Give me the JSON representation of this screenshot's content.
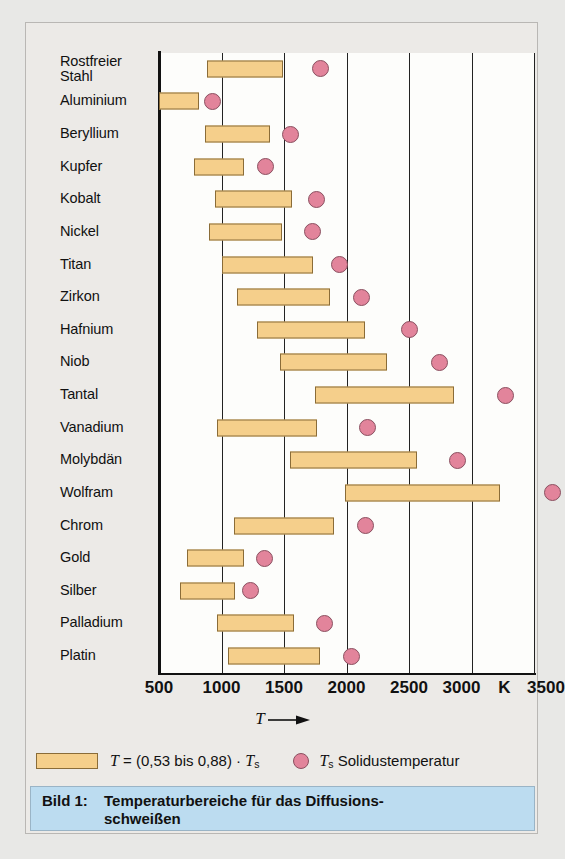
{
  "chart_data": {
    "type": "bar",
    "xlabel": "T",
    "ylabel": "",
    "unit": "K",
    "xlim": [
      500,
      3500
    ],
    "xticks": [
      500,
      1000,
      1500,
      2000,
      2500,
      3000,
      3500
    ],
    "xtick_labels": [
      "500",
      "1000",
      "1500",
      "2000",
      "2500",
      "3000",
      "3500"
    ],
    "grid": true,
    "orientation": "horizontal",
    "categories": [
      "Rostfreier Stahl",
      "Aluminium",
      "Beryllium",
      "Kupfer",
      "Kobalt",
      "Nickel",
      "Titan",
      "Zirkon",
      "Hafnium",
      "Niob",
      "Tantal",
      "Vanadium",
      "Molybdän",
      "Wolfram",
      "Chrom",
      "Gold",
      "Silber",
      "Palladium",
      "Platin"
    ],
    "series": [
      {
        "name": "T = (0,53 bis 0,88) · Ts",
        "type": "range-bar",
        "color": "#f5cf8b",
        "ranges": [
          [
            880,
            1490
          ],
          [
            500,
            820
          ],
          [
            870,
            1390
          ],
          [
            780,
            1180
          ],
          [
            950,
            1560
          ],
          [
            900,
            1480
          ],
          [
            1000,
            1730
          ],
          [
            1120,
            1870
          ],
          [
            1280,
            2150
          ],
          [
            1470,
            2320
          ],
          [
            1750,
            2860
          ],
          [
            960,
            1760
          ],
          [
            1550,
            2560
          ],
          [
            1990,
            3230
          ],
          [
            1100,
            1900
          ],
          [
            720,
            1180
          ],
          [
            670,
            1110
          ],
          [
            960,
            1580
          ],
          [
            1050,
            1790
          ]
        ]
      },
      {
        "name": "Ts Solidustemperatur",
        "type": "point",
        "color": "#e2849b",
        "values": [
          1790,
          930,
          1550,
          1350,
          1760,
          1730,
          1940,
          2120,
          2500,
          2740,
          3270,
          2170,
          2890,
          3650,
          2150,
          1340,
          1230,
          1820,
          2040
        ]
      }
    ]
  },
  "rows": [
    {
      "label": "Rostfreier Stahl",
      "label_lines": [
        "Rostfreier",
        "Stahl"
      ],
      "bar_min": 880,
      "bar_max": 1490,
      "dot": 1790
    },
    {
      "label": "Aluminium",
      "label_lines": [
        "Aluminium"
      ],
      "bar_min": 500,
      "bar_max": 820,
      "dot": 930
    },
    {
      "label": "Beryllium",
      "label_lines": [
        "Beryllium"
      ],
      "bar_min": 870,
      "bar_max": 1390,
      "dot": 1550
    },
    {
      "label": "Kupfer",
      "label_lines": [
        "Kupfer"
      ],
      "bar_min": 780,
      "bar_max": 1180,
      "dot": 1350
    },
    {
      "label": "Kobalt",
      "label_lines": [
        "Kobalt"
      ],
      "bar_min": 950,
      "bar_max": 1560,
      "dot": 1760
    },
    {
      "label": "Nickel",
      "label_lines": [
        "Nickel"
      ],
      "bar_min": 900,
      "bar_max": 1480,
      "dot": 1730
    },
    {
      "label": "Titan",
      "label_lines": [
        "Titan"
      ],
      "bar_min": 1000,
      "bar_max": 1730,
      "dot": 1940
    },
    {
      "label": "Zirkon",
      "label_lines": [
        "Zirkon"
      ],
      "bar_min": 1120,
      "bar_max": 1870,
      "dot": 2120
    },
    {
      "label": "Hafnium",
      "label_lines": [
        "Hafnium"
      ],
      "bar_min": 1280,
      "bar_max": 2150,
      "dot": 2500
    },
    {
      "label": "Niob",
      "label_lines": [
        "Niob"
      ],
      "bar_min": 1470,
      "bar_max": 2320,
      "dot": 2740
    },
    {
      "label": "Tantal",
      "label_lines": [
        "Tantal"
      ],
      "bar_min": 1750,
      "bar_max": 2860,
      "dot": 3270
    },
    {
      "label": "Vanadium",
      "label_lines": [
        "Vanadium"
      ],
      "bar_min": 960,
      "bar_max": 1760,
      "dot": 2170
    },
    {
      "label": "Molybdän",
      "label_lines": [
        "Molybdän"
      ],
      "bar_min": 1550,
      "bar_max": 2560,
      "dot": 2890
    },
    {
      "label": "Wolfram",
      "label_lines": [
        "Wolfram"
      ],
      "bar_min": 1990,
      "bar_max": 3230,
      "dot": 3650
    },
    {
      "label": "Chrom",
      "label_lines": [
        "Chrom"
      ],
      "bar_min": 1100,
      "bar_max": 1900,
      "dot": 2150
    },
    {
      "label": "Gold",
      "label_lines": [
        "Gold"
      ],
      "bar_min": 720,
      "bar_max": 1180,
      "dot": 1340
    },
    {
      "label": "Silber",
      "label_lines": [
        "Silber"
      ],
      "bar_min": 670,
      "bar_max": 1110,
      "dot": 1230
    },
    {
      "label": "Palladium",
      "label_lines": [
        "Palladium"
      ],
      "bar_min": 960,
      "bar_max": 1580,
      "dot": 1820
    },
    {
      "label": "Platin",
      "label_lines": [
        "Platin"
      ],
      "bar_min": 1050,
      "bar_max": 1790,
      "dot": 2040
    }
  ],
  "axis": {
    "ticks": [
      "500",
      "1000",
      "1500",
      "2000",
      "2500",
      "3000",
      "3500"
    ],
    "unit": "K",
    "caption_symbol": "T"
  },
  "legend": {
    "bar_formula": "T = (0,53 bis 0,88) · Ts",
    "bar_formula_parts": {
      "sym": "T",
      "eq": " = (0,53 bis 0,88) · ",
      "sym2": "T",
      "sub2": "s"
    },
    "dot_label": "Ts Solidustemperatur",
    "dot_label_parts": {
      "sym": "T",
      "sub": "s",
      "text": " Solidustemperatur"
    }
  },
  "caption": {
    "number": "Bild 1:",
    "line1": "Temperaturbereiche für das Diffusions-",
    "line2": "schweißen"
  },
  "colors": {
    "bar_fill": "#f5cf8b",
    "bar_stroke": "#8a6c38",
    "dot_fill": "#e2849b",
    "dot_stroke": "#8a5060",
    "caption_bg": "#bcdcf0",
    "panel_bg": "#eceae7",
    "plot_bg": "#fdfdfb"
  }
}
